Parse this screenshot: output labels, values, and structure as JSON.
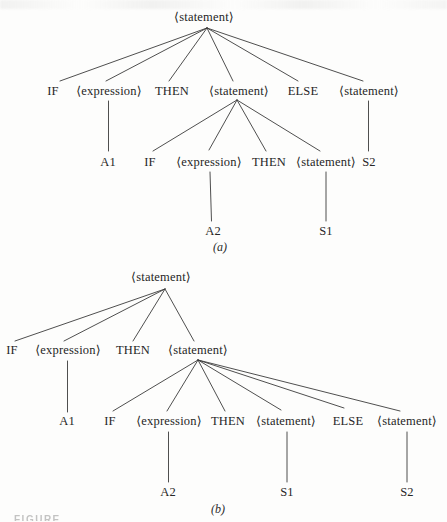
{
  "figure": {
    "ink_color": "#3b3b3b",
    "background_color": "#fdfdfc"
  },
  "tree_a": {
    "root": "⟨statement⟩",
    "level2": [
      "IF",
      "⟨expression⟩",
      "THEN",
      "⟨statement⟩",
      "ELSE",
      "⟨statement⟩"
    ],
    "level3": [
      "A1",
      "IF",
      "⟨expression⟩",
      "THEN",
      "⟨statement⟩",
      "S2"
    ],
    "level4": [
      "A2",
      "S1"
    ],
    "caption": "(a)"
  },
  "tree_b": {
    "root": "⟨statement⟩",
    "level2": [
      "IF",
      "⟨expression⟩",
      "THEN",
      "⟨statement⟩"
    ],
    "level3": [
      "A1",
      "IF",
      "⟨expression⟩",
      "THEN",
      "⟨statement⟩",
      "ELSE",
      "⟨statement⟩"
    ],
    "level4": [
      "A2",
      "S1",
      "S2"
    ],
    "caption": "(b)"
  },
  "footer": {
    "cropped_caption_fragment": "FIGURE"
  }
}
